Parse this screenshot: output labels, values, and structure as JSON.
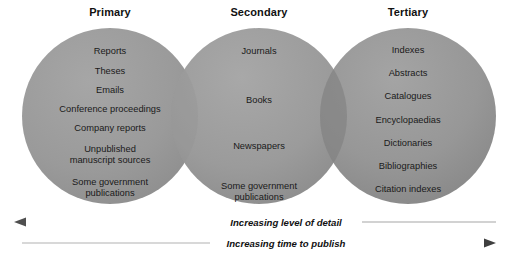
{
  "figure": {
    "type": "venn-diagram",
    "background": "#ffffff",
    "circle_fill": "#9a9a9a",
    "circle_overlap_fill": "#848484",
    "text_color": "#1a1a1a"
  },
  "circles": [
    {
      "id": "primary",
      "heading": "Primary",
      "heading_x": 110,
      "cx": 110,
      "cy": 116,
      "r": 88,
      "items": [
        {
          "label": "Reports",
          "y": 46
        },
        {
          "label": "Theses",
          "y": 66
        },
        {
          "label": "Emails",
          "y": 85
        },
        {
          "label": "Conference proceedings",
          "y": 104
        },
        {
          "label": "Company reports",
          "y": 123
        },
        {
          "label": "Unpublished\nmanuscript sources",
          "y": 144
        },
        {
          "label": "Some government\npublications",
          "y": 177
        }
      ]
    },
    {
      "id": "secondary",
      "heading": "Secondary",
      "heading_x": 259,
      "cx": 259,
      "cy": 116,
      "r": 88,
      "items": [
        {
          "label": "Journals",
          "y": 46
        },
        {
          "label": "Books",
          "y": 95
        },
        {
          "label": "Newspapers",
          "y": 141
        },
        {
          "label": "Some government\npublications",
          "y": 181
        }
      ]
    },
    {
      "id": "tertiary",
      "heading": "Tertiary",
      "heading_x": 408,
      "cx": 408,
      "cy": 116,
      "r": 88,
      "items": [
        {
          "label": "Indexes",
          "y": 45
        },
        {
          "label": "Abstracts",
          "y": 68
        },
        {
          "label": "Catalogues",
          "y": 91
        },
        {
          "label": "Encyclopaedias",
          "y": 115
        },
        {
          "label": "Dictionaries",
          "y": 138
        },
        {
          "label": "Bibliographies",
          "y": 161
        },
        {
          "label": "Citation indexes",
          "y": 184
        }
      ]
    }
  ],
  "axes": [
    {
      "id": "level-of-detail",
      "label": "Increasing level of detail",
      "direction": "left",
      "y": 222,
      "label_cx": 286,
      "dark_color": "#555555",
      "light_color": "#d2d2d2"
    },
    {
      "id": "time-to-publish",
      "label": "Increasing time to publish",
      "direction": "right",
      "y": 243,
      "label_cx": 286,
      "dark_color": "#555555",
      "light_color": "#d2d2d2"
    }
  ]
}
